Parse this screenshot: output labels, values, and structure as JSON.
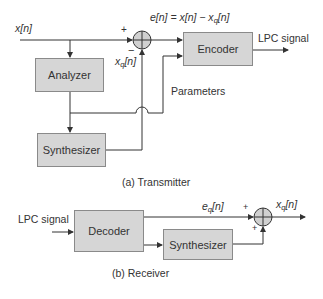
{
  "transmitter": {
    "caption": "(a) Transmitter",
    "input_label": "x[n]",
    "error_eq": "e[n] = x[n] − x",
    "error_eq_sub": "q",
    "error_eq_tail": "[n]",
    "feedback_label": "x",
    "feedback_sub": "q",
    "feedback_tail": "[n]",
    "plus_sign": "+",
    "minus_sign": "−",
    "blocks": {
      "analyzer": "Analyzer",
      "synthesizer": "Synthesizer",
      "encoder": "Encoder"
    },
    "parameters_label": "Parameters",
    "output_label": "LPC signal"
  },
  "receiver": {
    "caption": "(b) Receiver",
    "input_label": "LPC signal",
    "blocks": {
      "decoder": "Decoder",
      "synthesizer": "Synthesizer"
    },
    "eq_label": "e",
    "eq_sub": "q",
    "eq_tail": "[n]",
    "output_label": "x",
    "output_sub": "q",
    "output_tail": "[n]",
    "plus_top": "+",
    "plus_bottom": "+"
  },
  "colors": {
    "block_fill": "#d6d6d6",
    "block_border": "#8a8a8a",
    "line": "#333333",
    "junction_fill": "#d0d0d0"
  }
}
